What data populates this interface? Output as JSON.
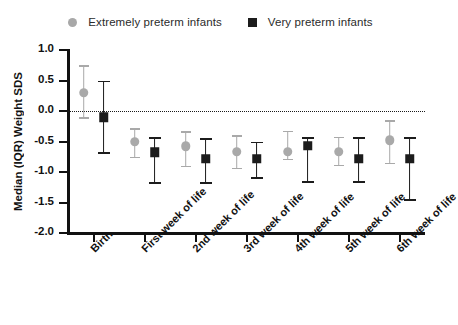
{
  "chart_data": {
    "type": "scatter",
    "title": "",
    "xlabel": "",
    "ylabel": "Median (IQR) Weight SDS",
    "ylim": [
      -2.0,
      1.0
    ],
    "yticks": [
      "1.0",
      "0.5",
      "0.0",
      "-0.5",
      "-1.0",
      "-1.5",
      "-2.0"
    ],
    "ytick_values": [
      1.0,
      0.5,
      0.0,
      -0.5,
      -1.0,
      -1.5,
      -2.0
    ],
    "grid": false,
    "reference_line": 0.0,
    "legend_position": "top-center",
    "categories": [
      "Birth",
      "First week of life",
      "2nd week of life",
      "3rd week of life",
      "4th week of life",
      "5th week of life",
      "6th week of life"
    ],
    "series": [
      {
        "name": "Extremely preterm infants",
        "marker": "circle",
        "color": "#a9a9a9",
        "values": [
          0.3,
          -0.5,
          -0.58,
          -0.67,
          -0.67,
          -0.67,
          -0.48
        ],
        "lower": [
          -0.1,
          -0.75,
          -0.9,
          -0.93,
          -0.78,
          -0.88,
          -0.85
        ],
        "upper": [
          0.75,
          -0.28,
          -0.33,
          -0.4,
          -0.32,
          -0.42,
          -0.15
        ]
      },
      {
        "name": "Very preterm infants",
        "marker": "square",
        "color": "#1c1c1c",
        "values": [
          -0.1,
          -0.68,
          -0.78,
          -0.78,
          -0.57,
          -0.78,
          -0.78
        ],
        "lower": [
          -0.68,
          -1.17,
          -1.17,
          -1.08,
          -1.15,
          -1.15,
          -1.45
        ],
        "upper": [
          0.5,
          -0.43,
          -0.45,
          -0.5,
          -0.42,
          -0.42,
          -0.43
        ]
      }
    ]
  },
  "legend": {
    "entries": [
      {
        "label": "Extremely preterm infants",
        "marker": "circle"
      },
      {
        "label": "Very preterm infants",
        "marker": "square"
      }
    ]
  }
}
